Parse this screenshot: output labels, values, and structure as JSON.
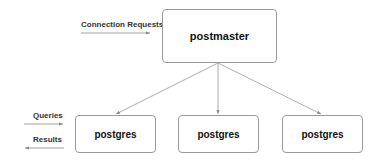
{
  "diagram": {
    "master": {
      "label": "postmaster"
    },
    "workers": [
      {
        "label": "postgres"
      },
      {
        "label": "postgres"
      },
      {
        "label": "postgres"
      }
    ],
    "inbound_label": "Connection Requests",
    "queries_label": "Queries",
    "results_label": "Results",
    "line_color": "#8a8a8a"
  }
}
